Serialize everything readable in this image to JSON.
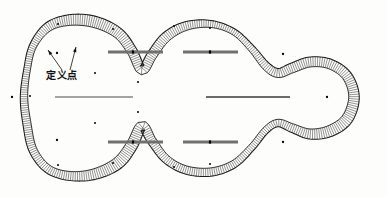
{
  "figure": {
    "background_color": "#fdfdfc",
    "outline_color": "#1a1a1a",
    "hatch_color": "#3a3a3a",
    "centerline_color": "#6b6b6b",
    "thin_line_color": "#4a4a4a",
    "point_color": "#000000",
    "annotation": {
      "label": "定义点",
      "label_x": 46,
      "label_y": 79,
      "leaders": [
        {
          "name": "leader-left",
          "from_x": 62,
          "from_y": 70,
          "to_x": 48,
          "to_y": 50
        },
        {
          "name": "leader-right",
          "from_x": 70,
          "from_y": 70,
          "to_x": 76,
          "to_y": 47
        }
      ]
    },
    "centerlines": [
      {
        "name": "centerline-upper-left",
        "x1": 108,
        "y1": 52,
        "x2": 163,
        "y2": 52,
        "weight": 3.0,
        "color": "#707070"
      },
      {
        "name": "centerline-upper-right",
        "x1": 183,
        "y1": 52,
        "x2": 238,
        "y2": 52,
        "weight": 3.0,
        "color": "#707070"
      },
      {
        "name": "centerline-middle-left",
        "x1": 55,
        "y1": 97,
        "x2": 133,
        "y2": 97,
        "weight": 1.0,
        "color": "#4a4a4a"
      },
      {
        "name": "centerline-middle-right",
        "x1": 206,
        "y1": 97,
        "x2": 290,
        "y2": 97,
        "weight": 2.2,
        "color": "#6b6b6b"
      },
      {
        "name": "centerline-lower-left",
        "x1": 108,
        "y1": 142,
        "x2": 163,
        "y2": 142,
        "weight": 3.0,
        "color": "#707070"
      },
      {
        "name": "centerline-lower-right",
        "x1": 183,
        "y1": 142,
        "x2": 238,
        "y2": 142,
        "weight": 3.0,
        "color": "#707070"
      }
    ],
    "centerline_marks": [
      {
        "name": "mark-upper-left",
        "x": 133,
        "y": 52
      },
      {
        "name": "mark-upper-right",
        "x": 210,
        "y": 52
      },
      {
        "name": "mark-lower-left",
        "x": 133,
        "y": 142
      },
      {
        "name": "mark-lower-right",
        "x": 210,
        "y": 142
      }
    ],
    "free_points": [
      {
        "name": "free-point-left",
        "x": 12,
        "y": 97
      },
      {
        "name": "free-point-upper-left-lobe",
        "x": 57,
        "y": 53
      },
      {
        "name": "free-point-lower-left-lobe",
        "x": 57,
        "y": 140
      },
      {
        "name": "free-point-upper-right",
        "x": 283,
        "y": 54
      },
      {
        "name": "free-point-lower-right",
        "x": 283,
        "y": 142
      },
      {
        "name": "free-point-right-tip",
        "x": 327,
        "y": 97
      }
    ],
    "outer_nodes": [
      {
        "name": "node-outer-1",
        "x": 58,
        "y": 24
      },
      {
        "name": "node-outer-2",
        "x": 113,
        "y": 29
      },
      {
        "name": "node-outer-3",
        "x": 174,
        "y": 26
      },
      {
        "name": "node-outer-4",
        "x": 210,
        "y": 28
      },
      {
        "name": "node-outer-5",
        "x": 138,
        "y": 82
      },
      {
        "name": "node-outer-6",
        "x": 58,
        "y": 165
      },
      {
        "name": "node-outer-7",
        "x": 113,
        "y": 163
      },
      {
        "name": "node-outer-8",
        "x": 174,
        "y": 167
      },
      {
        "name": "node-outer-9",
        "x": 210,
        "y": 164
      },
      {
        "name": "node-outer-10",
        "x": 138,
        "y": 112
      },
      {
        "name": "node-outer-11",
        "x": 30,
        "y": 96
      },
      {
        "name": "node-outer-12",
        "x": 95,
        "y": 73
      },
      {
        "name": "node-outer-13",
        "x": 95,
        "y": 123
      }
    ],
    "hatch": {
      "band_thickness": 9,
      "line_count": 420,
      "line_width": 0.55
    }
  }
}
